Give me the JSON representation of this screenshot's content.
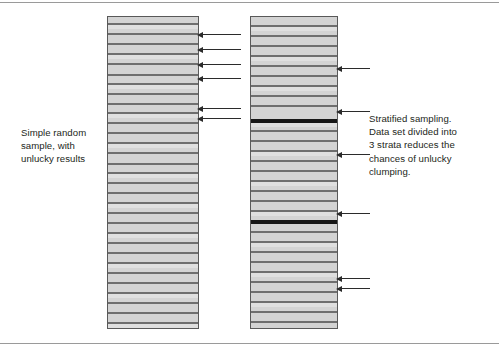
{
  "figure": {
    "background_color": "#ffffff",
    "rules": {
      "top_label": "top-divider-rule",
      "bottom_label": "bottom-divider-rule",
      "color": "#9a9a9a"
    }
  },
  "captions": {
    "left": "Simple random\nsample, with\nunlucky results",
    "right": "Stratified sampling.\nData set divided into\n3 strata reduces the\nchances of unlucky\nclumping."
  },
  "colors": {
    "bar_fill": "#d3d3d3",
    "bar_border": "#595959",
    "stripe": "#6e6e6e",
    "strata_divider": "#171717",
    "arrow": "#2b2b2b",
    "text": "#231f20"
  },
  "chart_data": {
    "type": "diagram",
    "panels": [
      {
        "id": "simple-random-sample",
        "label": "Simple random sample, with unlucky results",
        "x": 107,
        "y": 16,
        "width": 92,
        "height": 313,
        "strata_count": 1,
        "row_lines": [
          {
            "offset": 6,
            "thickness": 2
          },
          {
            "offset": 16,
            "thickness": 2
          },
          {
            "offset": 26,
            "thickness": 2
          },
          {
            "offset": 36,
            "thickness": 2
          },
          {
            "offset": 46,
            "thickness": 2
          },
          {
            "offset": 57,
            "thickness": 2
          },
          {
            "offset": 66,
            "thickness": 2
          },
          {
            "offset": 76,
            "thickness": 2
          },
          {
            "offset": 86,
            "thickness": 2
          },
          {
            "offset": 95,
            "thickness": 2
          },
          {
            "offset": 105,
            "thickness": 2
          },
          {
            "offset": 115,
            "thickness": 2
          },
          {
            "offset": 125,
            "thickness": 2
          },
          {
            "offset": 135,
            "thickness": 2
          },
          {
            "offset": 146,
            "thickness": 2
          },
          {
            "offset": 155,
            "thickness": 2
          },
          {
            "offset": 165,
            "thickness": 2
          },
          {
            "offset": 175,
            "thickness": 2
          },
          {
            "offset": 185,
            "thickness": 2
          },
          {
            "offset": 195,
            "thickness": 2
          },
          {
            "offset": 205,
            "thickness": 2
          },
          {
            "offset": 215,
            "thickness": 2
          },
          {
            "offset": 225,
            "thickness": 2
          },
          {
            "offset": 235,
            "thickness": 2
          },
          {
            "offset": 245,
            "thickness": 2
          },
          {
            "offset": 255,
            "thickness": 2
          },
          {
            "offset": 265,
            "thickness": 2
          },
          {
            "offset": 275,
            "thickness": 2
          },
          {
            "offset": 285,
            "thickness": 2
          },
          {
            "offset": 295,
            "thickness": 2
          },
          {
            "offset": 305,
            "thickness": 2
          }
        ],
        "sample_arrows_y": [
          18,
          33,
          48,
          62,
          92,
          102
        ],
        "sample_count": 6,
        "arrow_side": "right",
        "arrow_length": 44
      },
      {
        "id": "stratified-sample",
        "label": "Stratified sampling. Data set divided into 3 strata reduces the chances of unlucky clumping.",
        "x": 250,
        "y": 16,
        "width": 88,
        "height": 313,
        "strata_count": 3,
        "strata_divider_offsets": [
          102,
          203
        ],
        "row_lines": [
          {
            "offset": 8,
            "thickness": 2
          },
          {
            "offset": 18,
            "thickness": 2
          },
          {
            "offset": 28,
            "thickness": 2
          },
          {
            "offset": 38,
            "thickness": 2
          },
          {
            "offset": 48,
            "thickness": 2
          },
          {
            "offset": 58,
            "thickness": 2
          },
          {
            "offset": 68,
            "thickness": 2
          },
          {
            "offset": 78,
            "thickness": 2
          },
          {
            "offset": 88,
            "thickness": 2
          },
          {
            "offset": 102,
            "thickness": 4
          },
          {
            "offset": 113,
            "thickness": 2
          },
          {
            "offset": 123,
            "thickness": 2
          },
          {
            "offset": 133,
            "thickness": 2
          },
          {
            "offset": 143,
            "thickness": 2
          },
          {
            "offset": 153,
            "thickness": 2
          },
          {
            "offset": 163,
            "thickness": 2
          },
          {
            "offset": 173,
            "thickness": 2
          },
          {
            "offset": 183,
            "thickness": 2
          },
          {
            "offset": 193,
            "thickness": 2
          },
          {
            "offset": 203,
            "thickness": 4
          },
          {
            "offset": 214,
            "thickness": 2
          },
          {
            "offset": 224,
            "thickness": 2
          },
          {
            "offset": 234,
            "thickness": 2
          },
          {
            "offset": 244,
            "thickness": 2
          },
          {
            "offset": 254,
            "thickness": 2
          },
          {
            "offset": 264,
            "thickness": 2
          },
          {
            "offset": 274,
            "thickness": 2
          },
          {
            "offset": 284,
            "thickness": 2
          },
          {
            "offset": 294,
            "thickness": 2
          },
          {
            "offset": 304,
            "thickness": 2
          }
        ],
        "sample_arrows_y": [
          52,
          95,
          138,
          197,
          262,
          272
        ],
        "sample_count": 6,
        "arrow_side": "right",
        "arrow_length": 34
      }
    ]
  }
}
